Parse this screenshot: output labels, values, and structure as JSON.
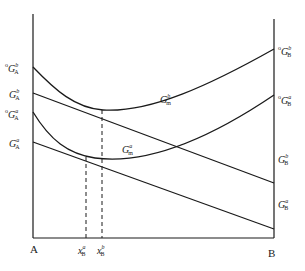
{
  "diagram": {
    "type": "gibbs-free-energy-composition",
    "axis": {
      "left_end": "A",
      "right_end": "B"
    },
    "labels": {
      "left": [
        {
          "id": "oGbA",
          "prefix": "o",
          "symbol": "G",
          "sup": "b",
          "sub": "A"
        },
        {
          "id": "GbA",
          "prefix": "",
          "symbol": "G",
          "sup": "b",
          "sub": "A"
        },
        {
          "id": "oGaA",
          "prefix": "o",
          "symbol": "G",
          "sup": "a",
          "sub": "A"
        },
        {
          "id": "GaA",
          "prefix": "",
          "symbol": "G",
          "sup": "a",
          "sub": "A"
        }
      ],
      "right": [
        {
          "id": "oGbB",
          "prefix": "o",
          "symbol": "G",
          "sup": "b",
          "sub": "B"
        },
        {
          "id": "oGaB",
          "prefix": "o",
          "symbol": "G",
          "sup": "a",
          "sub": "B"
        },
        {
          "id": "GbB",
          "prefix": "",
          "symbol": "G",
          "sup": "b",
          "sub": "B"
        },
        {
          "id": "GaB",
          "prefix": "",
          "symbol": "G",
          "sup": "a",
          "sub": "B"
        }
      ],
      "curves": [
        {
          "id": "Gbm",
          "symbol": "G",
          "sup": "b",
          "sub": "m"
        },
        {
          "id": "Gam",
          "symbol": "G",
          "sup": "a",
          "sub": "m"
        }
      ],
      "bottom": [
        {
          "id": "xaB",
          "symbol": "x",
          "sup": "a",
          "sub": "B"
        },
        {
          "id": "xbB",
          "symbol": "x",
          "sup": "b",
          "sub": "B"
        }
      ]
    },
    "colors": {
      "line": "#1a1a1a",
      "background": "#ffffff"
    }
  }
}
